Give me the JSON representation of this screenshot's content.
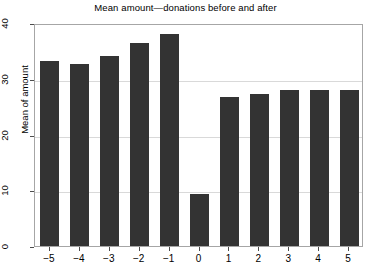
{
  "chart_data": {
    "type": "bar",
    "title": "Mean amount—donations before and after",
    "xlabel": "",
    "ylabel": "Mean of amount",
    "categories": [
      "−5",
      "−4",
      "−3",
      "−2",
      "−1",
      "0",
      "1",
      "2",
      "3",
      "4",
      "5"
    ],
    "values": [
      33.6,
      33.0,
      34.5,
      36.8,
      38.3,
      9.7,
      27.0,
      27.7,
      28.3,
      28.3,
      28.3
    ],
    "ylim": [
      0,
      40
    ],
    "yticks": [
      0,
      10,
      20,
      30,
      40
    ],
    "ytick_labels": [
      "0",
      "10",
      "20",
      "30",
      "40"
    ],
    "grid": true,
    "legend": "none",
    "bar_color": "#333333",
    "grid_color": "#d9d9d9",
    "frame_color": "#a6a6a6"
  }
}
